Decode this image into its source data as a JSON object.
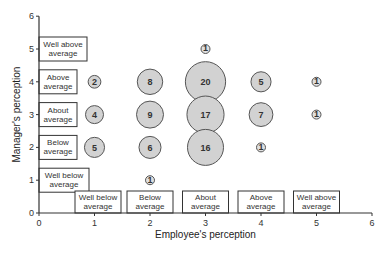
{
  "chart_data": {
    "type": "scatter",
    "subtype": "bubble",
    "title": "",
    "xlabel": "Employee's perception",
    "ylabel": "Manager's perception",
    "xlim": [
      0,
      6
    ],
    "ylim": [
      0,
      6
    ],
    "x_ticks": [
      0,
      1,
      2,
      3,
      4,
      5,
      6
    ],
    "y_ticks": [
      0,
      1,
      2,
      3,
      4,
      5,
      6
    ],
    "x_categories": [
      {
        "value": 1,
        "label": [
          "Well below",
          "average"
        ]
      },
      {
        "value": 2,
        "label": [
          "Below",
          "average"
        ]
      },
      {
        "value": 3,
        "label": [
          "About",
          "average"
        ]
      },
      {
        "value": 4,
        "label": [
          "Above",
          "average"
        ]
      },
      {
        "value": 5,
        "label": [
          "Well above",
          "average"
        ]
      }
    ],
    "y_categories": [
      {
        "value": 1,
        "label": [
          "Well below",
          "average"
        ]
      },
      {
        "value": 2,
        "label": [
          "Below",
          "average"
        ]
      },
      {
        "value": 3,
        "label": [
          "About",
          "average"
        ]
      },
      {
        "value": 4,
        "label": [
          "Above",
          "average"
        ]
      },
      {
        "value": 5,
        "label": [
          "Well above",
          "average"
        ]
      }
    ],
    "points": [
      {
        "x": 1,
        "y": 4,
        "count": 2
      },
      {
        "x": 1,
        "y": 3,
        "count": 4
      },
      {
        "x": 1,
        "y": 2,
        "count": 5
      },
      {
        "x": 2,
        "y": 4,
        "count": 8
      },
      {
        "x": 2,
        "y": 3,
        "count": 9
      },
      {
        "x": 2,
        "y": 2,
        "count": 6
      },
      {
        "x": 2,
        "y": 1,
        "count": 1
      },
      {
        "x": 3,
        "y": 5,
        "count": 1
      },
      {
        "x": 3,
        "y": 4,
        "count": 20
      },
      {
        "x": 3,
        "y": 3,
        "count": 17
      },
      {
        "x": 3,
        "y": 2,
        "count": 16
      },
      {
        "x": 4,
        "y": 4,
        "count": 5
      },
      {
        "x": 4,
        "y": 3,
        "count": 7
      },
      {
        "x": 4,
        "y": 2,
        "count": 1
      },
      {
        "x": 5,
        "y": 4,
        "count": 1
      },
      {
        "x": 5,
        "y": 3,
        "count": 1
      }
    ],
    "grid": false,
    "legend": "none",
    "colors": {
      "bubble_fill": "#d2d2d2",
      "bubble_stroke": "#555555",
      "axis": "#333333"
    }
  }
}
